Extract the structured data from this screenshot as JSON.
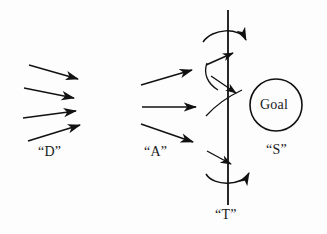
{
  "figure": {
    "type": "diagram",
    "title": "",
    "background_color": "#fdfdfd",
    "stroke_color": "#111111",
    "text_color": "#1a1a1a",
    "width": 327,
    "height": 234
  },
  "labels": {
    "d": "“D”",
    "a": "“A”",
    "s": "“S”",
    "t": "“T”",
    "goal": "Goal"
  },
  "groups": {
    "d_group": {
      "name": "D",
      "label": "“D”",
      "arrow_count": 4,
      "description": "four short straight arrows pointing right and slightly downward/upward"
    },
    "a_group": {
      "name": "A",
      "label": "“A”",
      "arrow_count": 3,
      "description": "three straight arrows pointing right toward the vertical line"
    },
    "t_axis": {
      "name": "T",
      "label": "“T”",
      "description": "vertical line with two horizontal arcing arrows crossing it"
    },
    "s_group": {
      "name": "S",
      "label": "“S”",
      "description": "circle labelled Goal"
    }
  },
  "shapes": {
    "circle": {
      "name": "goal-circle",
      "cx": 276,
      "cy": 105,
      "r": 26,
      "label": "Goal"
    },
    "vertical_line": {
      "name": "t-axis-line",
      "x": 228,
      "y1": 10,
      "y2": 205
    }
  }
}
